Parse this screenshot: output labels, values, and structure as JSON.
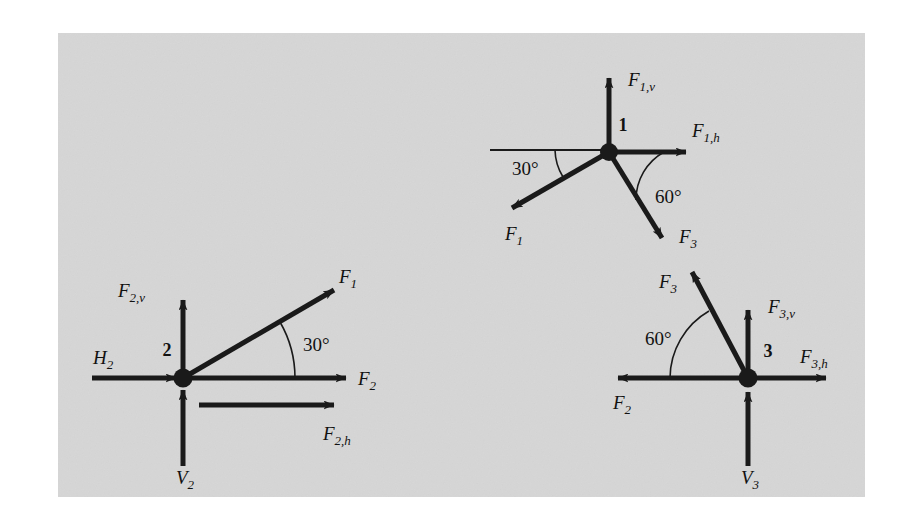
{
  "figure": {
    "panel_color": "#dcdcdc",
    "ink_color": "#1a1a1a",
    "page_color": "#ffffff"
  },
  "joints": [
    {
      "id": "joint-1",
      "number_label": "1",
      "angles": [
        {
          "name": "angle-30-joint-1",
          "text": "30°"
        },
        {
          "name": "angle-60-joint-1",
          "text": "60°"
        }
      ],
      "vectors": [
        {
          "name": "f1v",
          "base": "F",
          "sub": "1,v",
          "direction": "up"
        },
        {
          "name": "f1h",
          "base": "F",
          "sub": "1,h",
          "direction": "right"
        },
        {
          "name": "f1",
          "base": "F",
          "sub": "1",
          "direction": "down-left"
        },
        {
          "name": "f3",
          "base": "F",
          "sub": "3",
          "direction": "down-right"
        }
      ]
    },
    {
      "id": "joint-2",
      "number_label": "2",
      "angles": [
        {
          "name": "angle-30-joint-2",
          "text": "30°"
        }
      ],
      "vectors": [
        {
          "name": "f2v",
          "base": "F",
          "sub": "2,v",
          "direction": "up"
        },
        {
          "name": "f1",
          "base": "F",
          "sub": "1",
          "direction": "up-right"
        },
        {
          "name": "f2",
          "base": "F",
          "sub": "2",
          "direction": "right"
        },
        {
          "name": "f2h",
          "base": "F",
          "sub": "2,h",
          "direction": "right"
        },
        {
          "name": "h2",
          "base": "H",
          "sub": "2",
          "direction": "right"
        },
        {
          "name": "v2",
          "base": "V",
          "sub": "2",
          "direction": "up"
        }
      ]
    },
    {
      "id": "joint-3",
      "number_label": "3",
      "angles": [
        {
          "name": "angle-60-joint-3",
          "text": "60°"
        }
      ],
      "vectors": [
        {
          "name": "f3",
          "base": "F",
          "sub": "3",
          "direction": "up-left"
        },
        {
          "name": "f3v",
          "base": "F",
          "sub": "3,v",
          "direction": "up"
        },
        {
          "name": "f3h",
          "base": "F",
          "sub": "3,h",
          "direction": "right"
        },
        {
          "name": "f2",
          "base": "F",
          "sub": "2",
          "direction": "left"
        },
        {
          "name": "v3",
          "base": "V",
          "sub": "3",
          "direction": "up"
        }
      ]
    }
  ],
  "labels": {
    "joint1_number": "1",
    "joint2_number": "2",
    "joint3_number": "3",
    "j1_f1v_base": "F",
    "j1_f1v_sub": "1,v",
    "j1_f1h_base": "F",
    "j1_f1h_sub": "1,h",
    "j1_f1_base": "F",
    "j1_f1_sub": "1",
    "j1_f3_base": "F",
    "j1_f3_sub": "3",
    "j1_angle30": "30°",
    "j1_angle60": "60°",
    "j2_f2v_base": "F",
    "j2_f2v_sub": "2,v",
    "j2_f1_base": "F",
    "j2_f1_sub": "1",
    "j2_f2_base": "F",
    "j2_f2_sub": "2",
    "j2_f2h_base": "F",
    "j2_f2h_sub": "2,h",
    "j2_h2_base": "H",
    "j2_h2_sub": "2",
    "j2_v2_base": "V",
    "j2_v2_sub": "2",
    "j2_angle30": "30°",
    "j3_f3_base": "F",
    "j3_f3_sub": "3",
    "j3_f3v_base": "F",
    "j3_f3v_sub": "3,v",
    "j3_f3h_base": "F",
    "j3_f3h_sub": "3,h",
    "j3_f2_base": "F",
    "j3_f2_sub": "2",
    "j3_v3_base": "V",
    "j3_v3_sub": "3",
    "j3_angle60": "60°"
  }
}
